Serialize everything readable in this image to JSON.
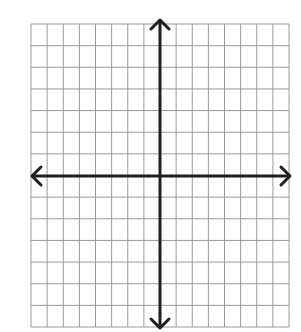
{
  "diagram": {
    "title": "",
    "type": "coordinate-plane",
    "grid": {
      "columns": 16,
      "rows": 14,
      "left": 31,
      "top": 24,
      "right": 289,
      "bottom": 327,
      "line_color": "#8f8f8f",
      "line_width": 0.9
    },
    "x_axis": {
      "y": 176,
      "from": 32,
      "to": 290,
      "color": "#1e1e1e",
      "width": 3,
      "arrows": [
        "left",
        "right"
      ]
    },
    "y_axis": {
      "x": 160,
      "from": 20,
      "to": 328,
      "color": "#1e1e1e",
      "width": 3,
      "arrows": [
        "up",
        "down"
      ]
    },
    "colors": {
      "background": "#ffffff"
    }
  }
}
